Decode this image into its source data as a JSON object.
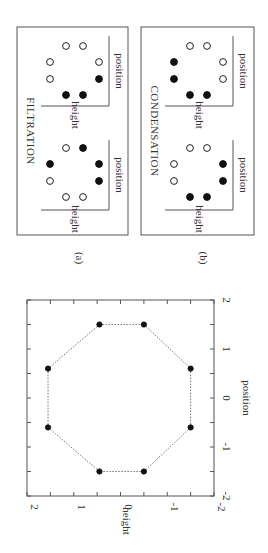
{
  "figure": {
    "panel_a_caption": "(a)",
    "panel_b_caption": "(b)",
    "panel_a_title": "FILTRATION",
    "panel_b_title": "CONDENSATION",
    "mini_xlabel": "position",
    "mini_ylabel": "height"
  },
  "mini_panels": {
    "a_left": {
      "filled": [
        [
          0,
          0
        ],
        [
          1,
          0
        ],
        [
          2,
          0.55
        ],
        [
          2,
          1.45
        ],
        [
          1,
          2
        ]
      ],
      "open": [
        [
          0,
          1
        ],
        [
          0.35,
          0
        ]
      ]
    },
    "note": "schematic dot arrangements"
  },
  "chart_data": {
    "type": "scatter",
    "title": "",
    "xlabel": "position",
    "ylabel": "height",
    "xlim": [
      -2,
      2
    ],
    "ylim": [
      -2,
      2
    ],
    "xticks": [
      "-2",
      "-1",
      "0",
      "1",
      "2"
    ],
    "yticks": [
      "-2",
      "-1",
      "0",
      "1",
      "2"
    ],
    "grid": false,
    "connected": true,
    "closed": true,
    "line_style": "dotted",
    "points": [
      {
        "position": 1.5,
        "height": 0.45
      },
      {
        "position": 1.5,
        "height": -0.5
      },
      {
        "position": 0.6,
        "height": -1.5
      },
      {
        "position": -0.6,
        "height": -1.5
      },
      {
        "position": -1.5,
        "height": -0.5
      },
      {
        "position": -1.5,
        "height": 0.45
      },
      {
        "position": -0.6,
        "height": 1.55
      },
      {
        "position": 0.6,
        "height": 1.55
      }
    ]
  },
  "panels": {
    "filtration": {
      "left": {
        "filled": [
          "p1",
          "p2",
          "p3",
          "p4"
        ],
        "open": [
          "p5",
          "p6",
          "p7",
          "p8"
        ]
      },
      "right": {
        "filled": [
          "p1",
          "p2",
          "p3",
          "p4"
        ],
        "open": [
          "p5",
          "p6",
          "p7",
          "p8"
        ]
      }
    }
  }
}
